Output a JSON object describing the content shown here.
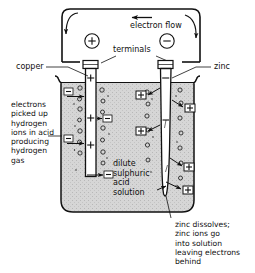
{
  "diagram": {
    "colors": {
      "ink": "#111111",
      "electrolyte_fill": "#d2d2d2",
      "electrode_fill": "#ffffff",
      "background": "#ffffff"
    },
    "circuit": {
      "flow_label": "electron flow",
      "terminals_label": "terminals",
      "positive_terminal_symbol": "+",
      "negative_terminal_symbol": "−",
      "flow_arrow_direction": "left"
    },
    "electrodes": [
      {
        "id": "copper",
        "label": "copper",
        "polarity": "+",
        "side": "left",
        "marks": [
          "+",
          "+"
        ]
      },
      {
        "id": "zinc",
        "label": "zinc",
        "polarity": "−",
        "side": "right",
        "marks": [
          "−"
        ]
      }
    ],
    "electrolyte": {
      "label_lines": [
        "dilute",
        "sulphuric",
        "acid",
        "solution"
      ]
    },
    "annotations": [
      {
        "id": "cathode-note",
        "position": "left",
        "lines": [
          "electrons",
          "picked up",
          "hydrogen",
          "ions in acid",
          "producing",
          "hydrogen",
          "gas"
        ]
      },
      {
        "id": "anode-note",
        "position": "bottom-right",
        "lines": [
          "zinc dissolves;",
          "zinc ions go",
          "into solution",
          "leaving electrons",
          "behind"
        ]
      }
    ],
    "ion_symbols": {
      "electron": "−",
      "zinc_ion": "+",
      "hydrogen_ion": "+",
      "bubble": "o"
    }
  }
}
